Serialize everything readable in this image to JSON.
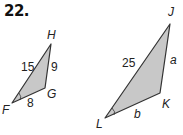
{
  "problem_number": "22.",
  "figures": [
    {
      "name": "triangle-FGH",
      "vertices": {
        "H": "H",
        "G": "G",
        "F": "F"
      },
      "sides": {
        "FH": "15",
        "GH": "9",
        "FG": "8"
      }
    },
    {
      "name": "triangle-JKL",
      "vertices": {
        "J": "J",
        "K": "K",
        "L": "L"
      },
      "sides": {
        "JL": "25",
        "JK": "a",
        "KL": "b"
      }
    }
  ],
  "colors": {
    "fill": "#c8c8c8",
    "stroke": "#333333"
  }
}
